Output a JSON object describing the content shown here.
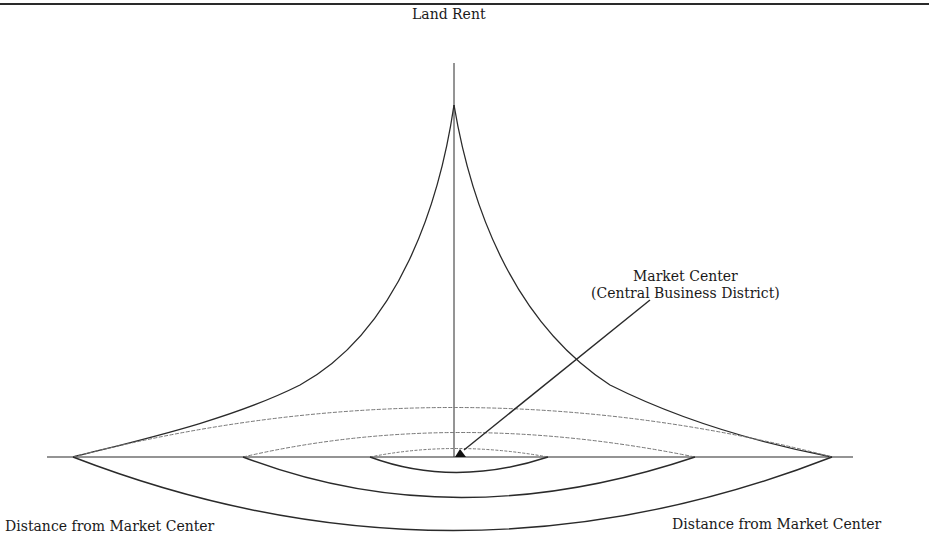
{
  "figure": {
    "axis_label_vertical": "Land Rent",
    "market_center_title": "Market Center",
    "market_center_subtitle": "(Central Business District)",
    "distance_label_left": "Distance from Market Center",
    "distance_label_right": "Distance from Market Center"
  },
  "colors": {
    "line": "#2a2a2a",
    "dotted_line": "#777777",
    "background": "#ffffff"
  },
  "geometry": {
    "center_x": 454,
    "baseline_y": 457,
    "peak_y": 105,
    "axis_top_y": 63,
    "baseline_left_x": 47,
    "baseline_right_x": 853,
    "rings": [
      {
        "name": "outer",
        "left_x": 73,
        "right_x": 832,
        "bottom_y": 530,
        "arc_top_y": 407
      },
      {
        "name": "middle",
        "left_x": 243,
        "right_x": 695,
        "bottom_y": 497,
        "arc_top_y": 432
      },
      {
        "name": "inner",
        "left_x": 370,
        "right_x": 548,
        "bottom_y": 472,
        "arc_top_y": 448
      }
    ],
    "arrow": {
      "from_x": 650,
      "from_y": 300,
      "to_x": 462,
      "to_y": 450
    }
  }
}
